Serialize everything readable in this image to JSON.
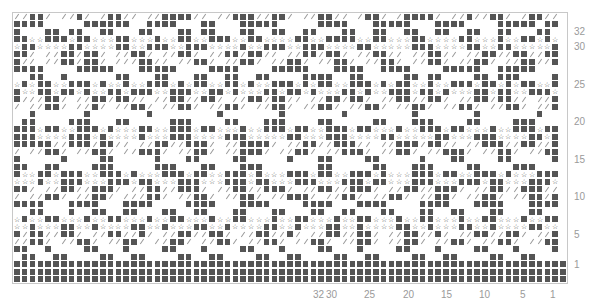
{
  "chart_title": "",
  "grid": {
    "columns": 71,
    "symbols": {
      ".": "empty",
      "#": "filled-square",
      "/": "slash",
      "*": "star"
    },
    "colors": {
      "filled": "#555555",
      "slash": "#9a9a9a",
      "star": "#444444",
      "border": "#c8c8c8"
    },
    "rows": [
      "//##/ //#/ /##// //####// //###//##/ //##// /##/ /####/ //#//##/ /##//",
      "####.....######..####...##...#####.....####...#####...####....#####.##",
      "#...##.##..##...##...##.##...##..##..##...##..##..##..##..##..##...##.",
      "##**###*##***##***#**##**###**##****##**####**##***##****##***#**##*#*",
      "*##****##****##**###**###****#**###**###****##*****###****##**##*****#",
      "##/ //##/##/ //##/ //##/ //##/##// //##/##/ //##// //##// //##//##//##",
      "#// //##/##/ ///##// //##/ //##/ //##/ //##/ //##/ //##/ //##/ //##//#",
      "####....#####...#####....####....#####...####..####....#####..#####...",
      "..##..#......##...##...##..##..##....####..##.....##.##....##.###....#",
      "*#*##**###*#**#**###*#*##**##*#**###*#*##**###*#*##**#**###*##*#*##**#",
      "#**##*##*#**##*###**###**##*#***##*##*#***##*#**###*##*#***##*##**###*",
      "#///##/ //##/##// //##//##/ //##/##// //##/##/ //##//##/ //##/##// //#",
      "/ //##/ //#/ //##/ //##/ //##/ //##/ //##/ //##/ //##/ //##/ //##/ //#",
      "..#......#.......#........#.......#.......#........#.......#.......#..",
      ".##....###...##.....###....##...###....##.....##...###....##....###...",
      "###*##**###*#***##**###*##***#**###*##**###*##***#**###*##***#**###*##",
      "###****###*#****#***###****###*****##***###****##*****##***###****##*#",
      "#####//###/##// //##//###/ //####/ //##//###// //###/##// //###//##//#",
      "/ //##/ //##/ //###/ //##/ //###/ //##/ //###/ //##/ //###/ //##/ //##",
      "#.....#....##.....#...##....##.....#...##....##.....#...##....##.....#",
      "##..##....###.....###...##...###.......##.....##...###....##....###...",
      "#**##*###**###*#***###*##**###*#***###*##**###*#***###*##**###*#***###",
      "***#**###***###*##***###***###*##***###***###*##***###***###*##***###*",
      "##/ //##//###/ //##//###/ //##//###/ //##//###/ //##//###/ //##//###//",
      "/ //##/ //##/ ///##/ //##/ //##/ //###/ //##/ //##/ //##/ //##/ //##/#",
      "####...####...####....####...####....####...####....####...####...####",
      "..##...#..##..##...##..##...##...##...##..##...##...##..##...##...##..",
      "*#**##***#**##***#**##***#**##***#**##***#**##***#**##***#**##***#**##",
      "**#***##**#****##**#***##**#****##**#***##**#****##**#***##**#****##**",
      "#/##//##/ //##//#/ //##//##/ //##//#/ //##//##/ //##//#/ //##//##/ //#",
      "//##/ //##/ //##/ //##/ //##/ //##/ //##/ //##/ //##/ //##/ //##/ //##",
      "##..#....##...#....##...#....##...#....##...#....##...#....##...#....#",
      ".##..##....##..##....##..##....##..##....##..##....##..##....##..##...",
      "#######################################################################",
      "#######################################################################",
      "#######################################################################"
    ]
  },
  "row_labels": [
    {
      "text": "32",
      "row": 2
    },
    {
      "text": "30",
      "row": 4
    },
    {
      "text": "25",
      "row": 9
    },
    {
      "text": "20",
      "row": 14
    },
    {
      "text": "15",
      "row": 19
    },
    {
      "text": "10",
      "row": 24
    },
    {
      "text": "5",
      "row": 29
    },
    {
      "text": "1",
      "row": 33
    }
  ],
  "column_labels": [
    {
      "text": "32",
      "x": 313
    },
    {
      "text": "30",
      "x": 326
    },
    {
      "text": "25",
      "x": 364
    },
    {
      "text": "20",
      "x": 403
    },
    {
      "text": "15",
      "x": 441
    },
    {
      "text": "10",
      "x": 479
    },
    {
      "text": "5",
      "x": 520
    },
    {
      "text": "1",
      "x": 550
    }
  ]
}
